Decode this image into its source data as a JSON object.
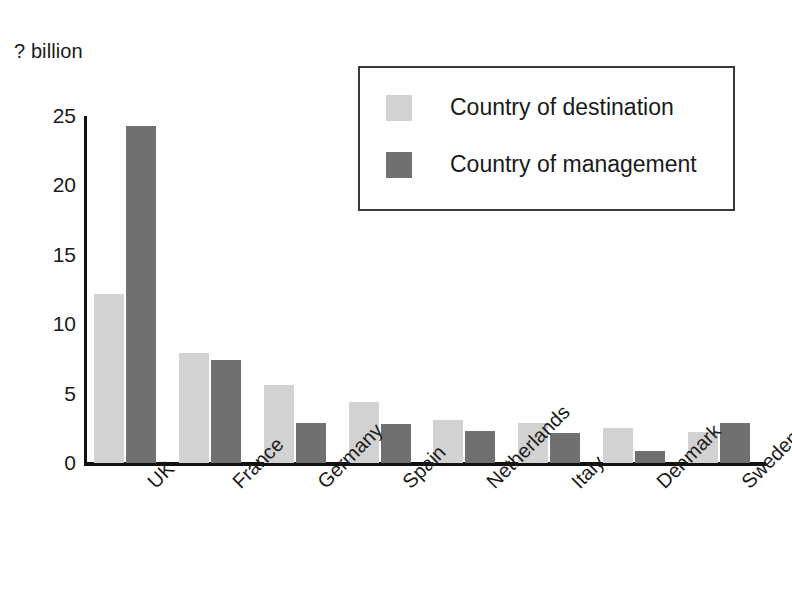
{
  "chart_data": {
    "type": "bar",
    "title": "",
    "subtitle": "",
    "xlabel": "",
    "ylabel": "? billion",
    "ylim": [
      0,
      25
    ],
    "yticks": [
      0,
      5,
      10,
      15,
      20,
      25
    ],
    "ytick_labels": [
      "0",
      "5",
      "10",
      "15",
      "20",
      "25"
    ],
    "grid": false,
    "legend_position": "top-right",
    "categories": [
      "UK",
      "France",
      "Germany",
      "Spain",
      "Netherlands",
      "Italy",
      "Denmark",
      "Sweden"
    ],
    "series": [
      {
        "name": "Country of destination",
        "color": "#d2d2d2",
        "values": [
          12.2,
          7.9,
          5.6,
          4.4,
          3.1,
          2.9,
          2.5,
          2.2
        ]
      },
      {
        "name": "Country of management",
        "color": "#707070",
        "values": [
          24.3,
          7.4,
          2.85,
          2.8,
          2.3,
          2.15,
          0.85,
          2.9
        ]
      }
    ]
  },
  "axis": {
    "unit_caption": "? billion"
  },
  "legend": {
    "items": [
      {
        "label": "Country of destination",
        "swatch": "dest"
      },
      {
        "label": "Country of management",
        "swatch": "mgmt"
      }
    ]
  },
  "colors": {
    "destination": "#d2d2d2",
    "management": "#707070",
    "axis": "#111111",
    "text": "#1a1a1a",
    "background": "#ffffff"
  }
}
